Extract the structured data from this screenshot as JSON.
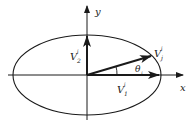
{
  "diagram": {
    "axes": {
      "x_label": "x",
      "y_label": "y"
    },
    "vectors": [
      {
        "name": "V1",
        "label_main": "V",
        "label_sub": "1",
        "label_sup": "i"
      },
      {
        "name": "V2",
        "label_main": "V",
        "label_sub": "2",
        "label_sup": "i"
      },
      {
        "name": "Vj",
        "label_main": "V",
        "label_sub": "j",
        "label_sup": "i"
      }
    ],
    "angle": {
      "label_main": "θ",
      "label_sub": "j"
    },
    "colors": {
      "stroke": "#1a1a1a",
      "background": "#ffffff"
    }
  }
}
